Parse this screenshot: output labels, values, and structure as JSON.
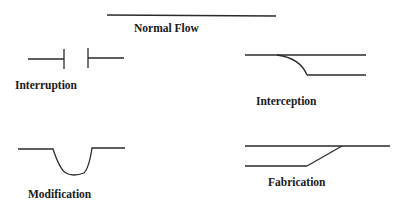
{
  "diagram": {
    "colors": {
      "stroke": "#2a2a2a",
      "text": "#1a1a1a",
      "background": "#ffffff"
    },
    "panels": [
      {
        "id": "normal-flow",
        "label": "Normal Flow"
      },
      {
        "id": "interruption",
        "label": "Interruption"
      },
      {
        "id": "interception",
        "label": "Interception"
      },
      {
        "id": "modification",
        "label": "Modification"
      },
      {
        "id": "fabrication",
        "label": "Fabrication"
      }
    ]
  }
}
